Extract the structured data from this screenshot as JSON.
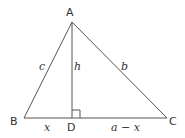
{
  "diagram": {
    "vertices": {
      "A": "A",
      "B": "B",
      "C": "C",
      "D": "D"
    },
    "sides": {
      "c": "c",
      "b": "b",
      "h": "h",
      "x": "x",
      "a_minus_x": "a − x"
    },
    "colors": {
      "line": "#555555",
      "text": "#333333"
    }
  }
}
